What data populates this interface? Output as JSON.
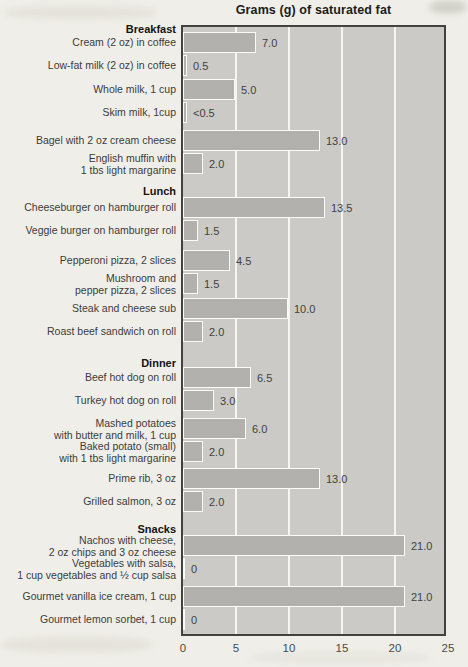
{
  "chart_data": {
    "type": "bar",
    "orientation": "horizontal",
    "title": "Grams (g) of saturated fat",
    "xlabel": "",
    "ylabel": "",
    "xlim": [
      0,
      25
    ],
    "xticks": [
      "0",
      "5",
      "10",
      "15",
      "20",
      "25"
    ],
    "gridlines_at": [
      5,
      10,
      15,
      20
    ],
    "grid": "vertical white gridlines on gray plot background",
    "legend": "none",
    "colors": {
      "page_bg": "#f0eee8",
      "plot_bg": "#cbcac6",
      "plot_border": "#424240",
      "bar_fill": "#b2b1ad",
      "bar_border": "#fbfbf8",
      "gridline": "#f5f5f2",
      "label_text": "#3c3c3c",
      "title_text": "#1c1c1c"
    },
    "groups": [
      {
        "category": "Breakfast",
        "items": [
          {
            "label_lines": [
              "Cream (2 oz) in coffee"
            ],
            "value": 7.0,
            "value_label": "7.0"
          },
          {
            "label_lines": [
              "Low-fat milk (2 oz) in coffee"
            ],
            "value": 0.5,
            "value_label": "0.5"
          },
          {
            "label_lines": [
              "Whole milk, 1 cup"
            ],
            "value": 5.0,
            "value_label": "5.0"
          },
          {
            "label_lines": [
              "Skim milk, 1cup"
            ],
            "value": 0.4,
            "value_label": "<0.5"
          },
          {
            "label_lines": [
              "Bagel with 2 oz cream cheese"
            ],
            "value": 13.0,
            "value_label": "13.0"
          },
          {
            "label_lines": [
              "English muffin with",
              "1 tbs light margarine"
            ],
            "value": 2.0,
            "value_label": "2.0"
          }
        ]
      },
      {
        "category": "Lunch",
        "items": [
          {
            "label_lines": [
              "Cheeseburger on hamburger roll"
            ],
            "value": 13.5,
            "value_label": "13.5"
          },
          {
            "label_lines": [
              "Veggie burger on hamburger roll"
            ],
            "value": 1.5,
            "value_label": "1.5"
          },
          {
            "label_lines": [
              "Pepperoni pizza, 2 slices"
            ],
            "value": 4.5,
            "value_label": "4.5"
          },
          {
            "label_lines": [
              "Mushroom and",
              "pepper pizza, 2 slices"
            ],
            "value": 1.5,
            "value_label": "1.5"
          },
          {
            "label_lines": [
              "Steak and cheese sub"
            ],
            "value": 10.0,
            "value_label": "10.0"
          },
          {
            "label_lines": [
              "Roast beef sandwich on roll"
            ],
            "value": 2.0,
            "value_label": "2.0"
          }
        ]
      },
      {
        "category": "Dinner",
        "items": [
          {
            "label_lines": [
              "Beef hot dog on roll"
            ],
            "value": 6.5,
            "value_label": "6.5"
          },
          {
            "label_lines": [
              "Turkey hot dog on roll"
            ],
            "value": 3.0,
            "value_label": "3.0"
          },
          {
            "label_lines": [
              "Mashed potatoes",
              "with butter and milk, 1 cup"
            ],
            "value": 6.0,
            "value_label": "6.0"
          },
          {
            "label_lines": [
              "Baked potato (small)",
              "with 1 tbs light margarine"
            ],
            "value": 2.0,
            "value_label": "2.0"
          },
          {
            "label_lines": [
              "Prime rib, 3 oz"
            ],
            "value": 13.0,
            "value_label": "13.0"
          },
          {
            "label_lines": [
              "Grilled salmon, 3 oz"
            ],
            "value": 2.0,
            "value_label": "2.0"
          }
        ]
      },
      {
        "category": "Snacks",
        "items": [
          {
            "label_lines": [
              "Nachos with cheese,",
              "2 oz chips and 3 oz cheese"
            ],
            "value": 21.0,
            "value_label": "21.0"
          },
          {
            "label_lines": [
              "Vegetables with salsa,",
              "1 cup vegetables and ½ cup salsa"
            ],
            "value": 0,
            "value_label": "0"
          },
          {
            "label_lines": [
              "Gourmet vanilla ice cream, 1 cup"
            ],
            "value": 21.0,
            "value_label": "21.0"
          },
          {
            "label_lines": [
              "Gourmet lemon sorbet, 1 cup"
            ],
            "value": 0,
            "value_label": "0"
          }
        ]
      }
    ]
  }
}
